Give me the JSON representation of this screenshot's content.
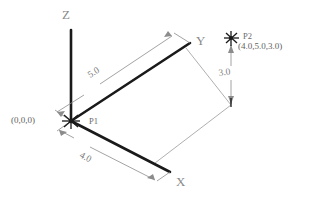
{
  "diagram": {
    "axes": [
      {
        "name": "z-axis",
        "label": "Z",
        "label_x": 62,
        "label_y": 19
      },
      {
        "name": "y-axis",
        "label": "Y",
        "label_x": 196,
        "label_y": 45
      },
      {
        "name": "x-axis",
        "label": "X",
        "label_x": 176,
        "label_y": 186
      }
    ],
    "points": [
      {
        "name": "origin",
        "label": "P1",
        "coords": "(0,0,0)",
        "label_x": 89,
        "label_y": 124,
        "coords_x": 11,
        "coords_y": 123
      },
      {
        "name": "p2",
        "label": "P2",
        "coords": "(4.0,5.0,3.0)",
        "label_x": 243,
        "label_y": 39,
        "coords_x": 238,
        "coords_y": 49
      }
    ],
    "dimensions": [
      {
        "name": "dim-y",
        "value": "5.0",
        "text_x": 90,
        "text_y": 78,
        "rotate": -31
      },
      {
        "name": "dim-x",
        "value": "4.0",
        "text_x": 79,
        "text_y": 157,
        "rotate": 28
      },
      {
        "name": "dim-z",
        "value": "3.0",
        "text_x": 219,
        "text_y": 76,
        "rotate": -8
      }
    ],
    "colors": {
      "axis": "#1a1a1a",
      "dimension": "#8c8c8c",
      "projection": "#9a9a9a",
      "text": "#6e6e6e",
      "background": "#ffffff"
    }
  }
}
